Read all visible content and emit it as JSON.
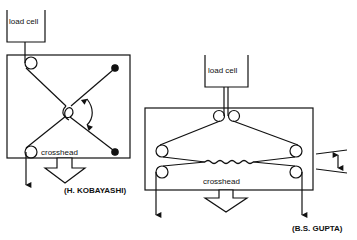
{
  "left_diagram": {
    "load_cell_label": "load cell",
    "crosshead_label": "crosshead",
    "credit": "(H. KOBAYASHI)"
  },
  "right_diagram": {
    "load_cell_label": "load cell",
    "crosshead_label": "crosshead",
    "credit": "(B.S. GUPTA)"
  },
  "colors": {
    "line": "#111111",
    "background": "#ffffff"
  }
}
